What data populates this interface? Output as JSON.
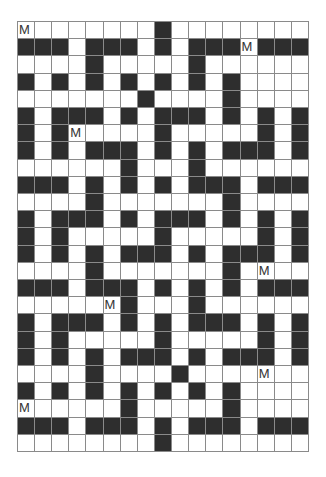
{
  "puzzle": {
    "type": "crossword-grid",
    "columns": 17,
    "rows": 25,
    "colors": {
      "black": "#2e2e2e",
      "white": "#ffffff",
      "border": "#8a8a8a",
      "text": "#333333"
    },
    "legend": {
      "B": "black square",
      "W": "white square",
      "M": "white square marked M"
    },
    "grid": [
      "MWWWWWWWBWWWWWWWW",
      "BBBWBBBWBWBBBMBBB",
      "WWWWBWWWWWBWWWWWW",
      "BWBWBWBWBWBWBWWWW",
      "WWWWWWWBWWWWBWWWW",
      "BWBBBWBWBBBWBWBWB",
      "BWBMWWWWBWWWWWBWB",
      "BWBWBBBWBWBWBBBWB",
      "WWWWWWBWWWBWWWWWW",
      "BBBWBWBWBWBBBWBBB",
      "WWWWBWWWWWWWBWWWW",
      "BWBBBWBWBBBWBWBWB",
      "BWBWWWWWBWWWWWBWB",
      "BWBWBWBBBWBWBBBWB",
      "WWWWBWWWWWWWBWMWW",
      "BBBWBBBWBWBWBWBBB",
      "WWWWWMBWWWBWWWWWW",
      "BWBBBWBWBWBBBWBWB",
      "BWBWWWWWBWWWWWBWB",
      "BWBWBWBBBWBWBBBWB",
      "WWWWBWWWWBWWWWMWW",
      "BWBWBWBWBWBWBWWWW",
      "MWWWWWBWWWWWBWWWW",
      "BBBWBBBWBWBBBWBBB",
      "WWWWWWWWBWWWWWWWW"
    ],
    "marker_label": "M"
  }
}
